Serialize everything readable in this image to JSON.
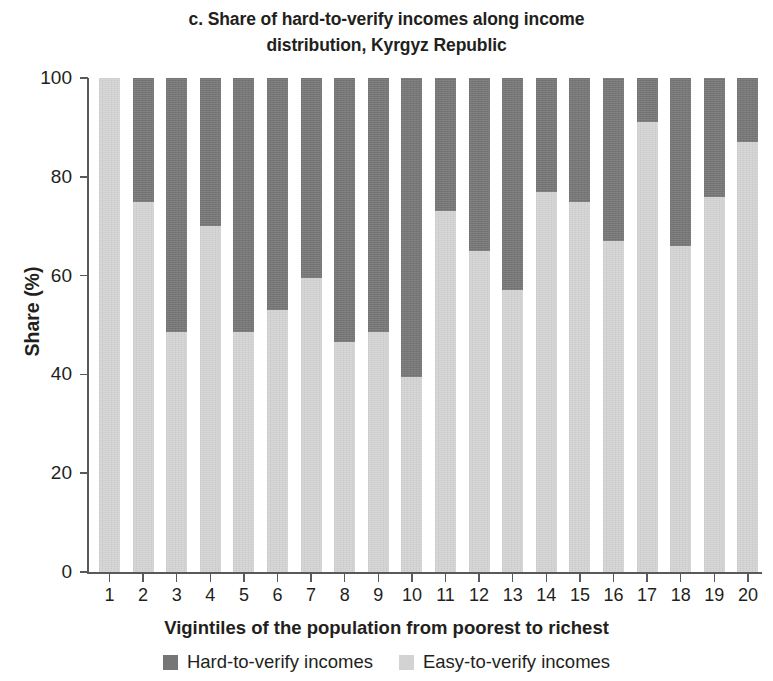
{
  "chart_data": {
    "type": "bar",
    "subtype": "stacked-percentage",
    "title_lines": [
      "c. Share of hard-to-verify incomes along income",
      "distribution, Kyrgyz Republic"
    ],
    "title": "c. Share of hard-to-verify incomes along income distribution, Kyrgyz Republic",
    "xlabel": "Vigintiles of the population from poorest to richest",
    "ylabel": "Share (%)",
    "ylim": [
      0,
      100
    ],
    "yticks": [
      0,
      20,
      40,
      60,
      80,
      100
    ],
    "ytick_labels": [
      "0",
      "20",
      "40",
      "60",
      "80",
      "100"
    ],
    "grid": false,
    "legend_position": "bottom",
    "categories": [
      "1",
      "2",
      "3",
      "4",
      "5",
      "6",
      "7",
      "8",
      "9",
      "10",
      "11",
      "12",
      "13",
      "14",
      "15",
      "16",
      "17",
      "18",
      "19",
      "20"
    ],
    "series": [
      {
        "name": "Easy-to-verify incomes",
        "color": "#d3d3d3",
        "values": [
          100,
          75,
          48.5,
          70,
          48.5,
          53,
          59.5,
          46.5,
          48.5,
          39.5,
          73,
          65,
          57,
          77,
          75,
          67,
          91,
          66,
          76,
          87
        ]
      },
      {
        "name": "Hard-to-verify incomes",
        "color": "#767676",
        "values": [
          0,
          25,
          51.5,
          30,
          51.5,
          47,
          40.5,
          53.5,
          51.5,
          60.5,
          27,
          35,
          43,
          23,
          25,
          33,
          9,
          34,
          24,
          13
        ]
      }
    ],
    "legend": [
      {
        "label": "Hard-to-verify incomes",
        "color": "#767676",
        "swatch": "hard-to-verify-swatch"
      },
      {
        "label": "Easy-to-verify incomes",
        "color": "#d3d3d3",
        "swatch": "easy-to-verify-swatch"
      }
    ]
  }
}
